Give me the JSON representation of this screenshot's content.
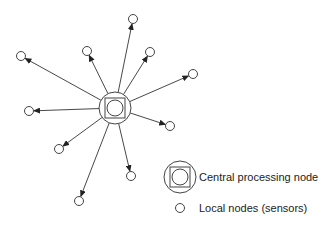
{
  "diagram": {
    "type": "star-network",
    "center": {
      "label": "Central processing node",
      "x": 115,
      "y": 108
    },
    "local_nodes": [
      {
        "x": 21,
        "y": 56
      },
      {
        "x": 87,
        "y": 51
      },
      {
        "x": 133,
        "y": 19
      },
      {
        "x": 150,
        "y": 52
      },
      {
        "x": 193,
        "y": 74
      },
      {
        "x": 29,
        "y": 111
      },
      {
        "x": 170,
        "y": 126
      },
      {
        "x": 59,
        "y": 149
      },
      {
        "x": 131,
        "y": 176
      },
      {
        "x": 79,
        "y": 201
      }
    ],
    "edge_direction": "center-to-local",
    "stroke_color": "#333333"
  },
  "legend": {
    "central_label": "Central processing node",
    "local_label": "Local nodes (sensors)"
  }
}
